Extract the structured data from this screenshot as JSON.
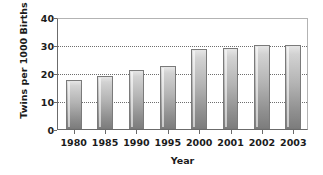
{
  "chart_data": {
    "type": "bar",
    "title": "",
    "xlabel": "Year",
    "ylabel": "Twins per 1000 Births",
    "categories": [
      "1980",
      "1985",
      "1990",
      "1995",
      "2000",
      "2001",
      "2002",
      "2003"
    ],
    "values": [
      17.5,
      19,
      21,
      22.5,
      28.5,
      29,
      30,
      30
    ],
    "ylim": [
      0,
      40
    ],
    "yticks": [
      0,
      10,
      20,
      30,
      40
    ],
    "ytick_labels": [
      "0",
      "10",
      "20",
      "30",
      "40"
    ],
    "grid": true,
    "gridlines_at": [
      10,
      20,
      30
    ],
    "legend": null,
    "bar_color": "#b4b4b4",
    "bar_border_color": "#7a7a7a",
    "axis_color": "#6b6b6b",
    "grid_color": "#6e6e6e",
    "text_color": "#1b1b1b"
  }
}
